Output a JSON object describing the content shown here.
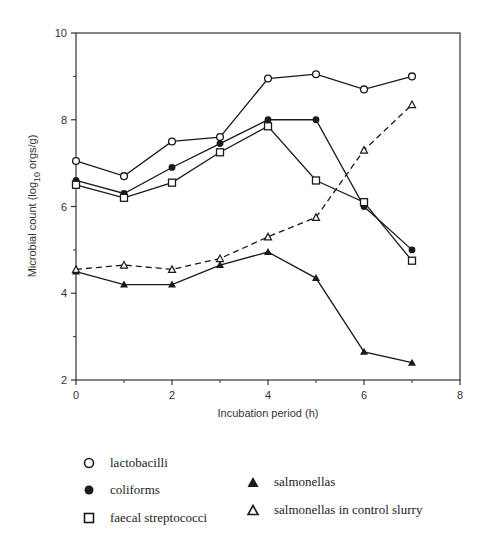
{
  "chart_data": {
    "type": "line",
    "title": "",
    "xlabel": "Incubation period (h)",
    "ylabel": "Microbial count (log10 orgs/g)",
    "ylabel_parts": {
      "main": "Microbial count  (log",
      "sub": "10",
      "tail": " orgs/g)"
    },
    "xlim": [
      0,
      8
    ],
    "ylim": [
      2,
      10
    ],
    "x_ticks": [
      0,
      2,
      4,
      6,
      8
    ],
    "y_ticks": [
      2,
      4,
      6,
      8,
      10
    ],
    "x_minor_ticks": [
      1,
      3,
      5,
      7
    ],
    "y_minor_ticks": [
      3,
      5,
      7,
      9
    ],
    "grid": false,
    "legend_position": "below",
    "x": [
      0,
      1,
      2,
      3,
      4,
      5,
      6,
      7
    ],
    "series": [
      {
        "name": "lactobacilli",
        "marker": "open-circle",
        "line": "solid",
        "values": [
          7.05,
          6.7,
          7.5,
          7.6,
          8.95,
          9.05,
          8.7,
          9.0
        ]
      },
      {
        "name": "coliforms",
        "marker": "filled-circle",
        "line": "solid",
        "values": [
          6.6,
          6.3,
          6.9,
          7.45,
          8.0,
          8.0,
          6.0,
          5.0
        ]
      },
      {
        "name": "faecal streptococci",
        "marker": "open-square",
        "line": "solid",
        "values": [
          6.5,
          6.2,
          6.55,
          7.25,
          7.85,
          6.6,
          6.1,
          4.75
        ]
      },
      {
        "name": "salmonellas",
        "marker": "filled-triangle",
        "line": "solid",
        "values": [
          4.5,
          4.2,
          4.2,
          4.65,
          4.95,
          4.35,
          2.65,
          2.4
        ]
      },
      {
        "name": "salmonellas in control slurry",
        "marker": "open-triangle",
        "line": "dashed",
        "values": [
          4.55,
          4.65,
          4.55,
          4.8,
          5.3,
          5.75,
          7.3,
          8.35
        ]
      }
    ]
  },
  "legend": {
    "items": [
      {
        "label": "lactobacilli",
        "marker": "open-circle"
      },
      {
        "label": "coliforms",
        "marker": "filled-circle"
      },
      {
        "label": "faecal streptococci",
        "marker": "open-square"
      },
      {
        "label": "salmonellas",
        "marker": "filled-triangle"
      },
      {
        "label": "salmonellas in control slurry",
        "marker": "open-triangle"
      }
    ]
  },
  "colors": {
    "ink": "#1a1a1a",
    "axis": "#333333",
    "background": "#ffffff"
  }
}
